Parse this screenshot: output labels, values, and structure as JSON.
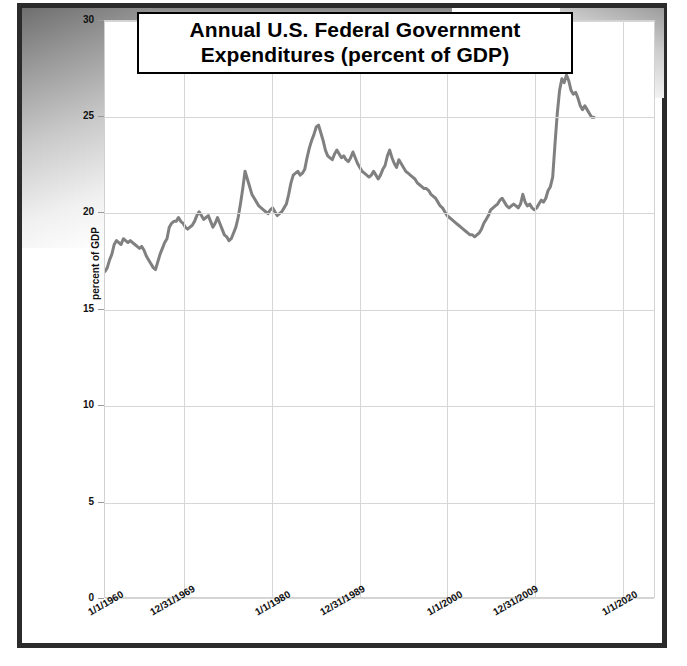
{
  "chart_data": {
    "type": "line",
    "title": "Annual U.S. Federal Government Expenditures (percent of GDP)",
    "title_line1": "Annual U.S. Federal Government",
    "title_line2": "Expenditures (percent of GDP)",
    "xlabel": "",
    "ylabel": "percent of GDP",
    "ylim": [
      0,
      30
    ],
    "yticks": [
      0,
      5,
      10,
      15,
      20,
      25,
      30
    ],
    "ytick_labels": [
      "0",
      "5",
      "10",
      "15",
      "20",
      "25",
      "30"
    ],
    "xlim": [
      "1/1/1960",
      "1/1/2020"
    ],
    "xtick_labels": [
      "1/1/1960",
      "12/31/1969",
      "1/1/1980",
      "12/31/1989",
      "1/1/2000",
      "12/31/2009",
      "1/1/2020"
    ],
    "grid": true,
    "legend": "none",
    "line_color": "#808080",
    "line_width": 3,
    "x_start_year": 1960.0,
    "x_end_year": 2020.0,
    "series": [
      {
        "name": "percent of GDP",
        "x": [
          1960.0,
          1960.25,
          1960.5,
          1960.75,
          1961.0,
          1961.25,
          1961.5,
          1961.75,
          1962.0,
          1962.25,
          1962.5,
          1962.75,
          1963.0,
          1963.25,
          1963.5,
          1963.75,
          1964.0,
          1964.25,
          1964.5,
          1964.75,
          1965.0,
          1965.25,
          1965.5,
          1965.75,
          1966.0,
          1966.25,
          1966.5,
          1966.75,
          1967.0,
          1967.25,
          1967.5,
          1967.75,
          1968.0,
          1968.25,
          1968.5,
          1968.75,
          1969.0,
          1969.25,
          1969.5,
          1969.75,
          1970.0,
          1970.25,
          1970.5,
          1970.75,
          1971.0,
          1971.25,
          1971.5,
          1971.75,
          1972.0,
          1972.25,
          1972.5,
          1972.75,
          1973.0,
          1973.25,
          1973.5,
          1973.75,
          1974.0,
          1974.25,
          1974.5,
          1974.75,
          1975.0,
          1975.25,
          1975.5,
          1975.75,
          1976.0,
          1976.25,
          1976.5,
          1976.75,
          1977.0,
          1977.25,
          1977.5,
          1977.75,
          1978.0,
          1978.25,
          1978.5,
          1978.75,
          1979.0,
          1979.25,
          1979.5,
          1979.75,
          1980.0,
          1980.25,
          1980.5,
          1980.75,
          1981.0,
          1981.25,
          1981.5,
          1981.75,
          1982.0,
          1982.25,
          1982.5,
          1982.75,
          1983.0,
          1983.25,
          1983.5,
          1983.75,
          1984.0,
          1984.25,
          1984.5,
          1984.75,
          1985.0,
          1985.25,
          1985.5,
          1985.75,
          1986.0,
          1986.25,
          1986.5,
          1986.75,
          1987.0,
          1987.25,
          1987.5,
          1987.75,
          1988.0,
          1988.25,
          1988.5,
          1988.75,
          1989.0,
          1989.25,
          1989.5,
          1989.75,
          1990.0,
          1990.25,
          1990.5,
          1990.75,
          1991.0,
          1991.25,
          1991.5,
          1991.75,
          1992.0,
          1992.25,
          1992.5,
          1992.75,
          1993.0,
          1993.25,
          1993.5,
          1993.75,
          1994.0,
          1994.25,
          1994.5,
          1994.75,
          1995.0,
          1995.25,
          1995.5,
          1995.75,
          1996.0,
          1996.25,
          1996.5,
          1996.75,
          1997.0,
          1997.25,
          1997.5,
          1997.75,
          1998.0,
          1998.25,
          1998.5,
          1998.75,
          1999.0,
          1999.25,
          1999.5,
          1999.75,
          2000.0,
          2000.25,
          2000.5,
          2000.75,
          2001.0,
          2001.25,
          2001.5,
          2001.75,
          2002.0,
          2002.25,
          2002.5,
          2002.75,
          2003.0,
          2003.25,
          2003.5,
          2003.75,
          2004.0,
          2004.25,
          2004.5,
          2004.75,
          2005.0,
          2005.25,
          2005.5,
          2005.75,
          2006.0,
          2006.25,
          2006.5,
          2006.75,
          2007.0,
          2007.25,
          2007.5,
          2007.75,
          2008.0,
          2008.25,
          2008.5,
          2008.75,
          2009.0,
          2009.25,
          2009.5,
          2009.75,
          2010.0,
          2010.25,
          2010.5,
          2010.75,
          2011.0,
          2011.25,
          2011.5,
          2011.75,
          2012.0,
          2012.25,
          2012.5,
          2012.75,
          2013.0,
          2013.25
        ],
        "values": [
          17.0,
          17.2,
          17.6,
          17.9,
          18.4,
          18.6,
          18.5,
          18.4,
          18.7,
          18.6,
          18.5,
          18.6,
          18.5,
          18.4,
          18.3,
          18.2,
          18.3,
          18.1,
          17.8,
          17.6,
          17.4,
          17.2,
          17.1,
          17.5,
          17.9,
          18.2,
          18.5,
          18.7,
          19.3,
          19.5,
          19.6,
          19.6,
          19.8,
          19.6,
          19.5,
          19.3,
          19.2,
          19.3,
          19.4,
          19.6,
          19.9,
          20.1,
          19.9,
          19.7,
          19.8,
          19.9,
          19.6,
          19.3,
          19.5,
          19.8,
          19.5,
          19.2,
          18.9,
          18.8,
          18.6,
          18.7,
          19.0,
          19.3,
          19.8,
          20.5,
          21.3,
          22.2,
          21.8,
          21.4,
          21.0,
          20.8,
          20.6,
          20.4,
          20.3,
          20.2,
          20.1,
          20.0,
          20.2,
          20.3,
          20.1,
          19.9,
          20.0,
          20.1,
          20.3,
          20.5,
          21.0,
          21.6,
          22.0,
          22.1,
          22.2,
          22.0,
          22.1,
          22.3,
          22.9,
          23.4,
          23.8,
          24.1,
          24.5,
          24.6,
          24.2,
          23.8,
          23.3,
          23.0,
          22.9,
          22.8,
          23.1,
          23.3,
          23.1,
          22.9,
          23.0,
          22.8,
          22.7,
          22.9,
          23.2,
          22.9,
          22.6,
          22.4,
          22.2,
          22.1,
          22.0,
          21.9,
          22.0,
          22.2,
          22.0,
          21.8,
          22.0,
          22.3,
          22.5,
          23.0,
          23.3,
          22.9,
          22.6,
          22.4,
          22.8,
          22.6,
          22.4,
          22.2,
          22.1,
          22.0,
          21.9,
          21.8,
          21.6,
          21.5,
          21.4,
          21.3,
          21.3,
          21.2,
          21.0,
          20.9,
          20.8,
          20.6,
          20.4,
          20.3,
          20.1,
          19.9,
          19.8,
          19.7,
          19.6,
          19.5,
          19.4,
          19.3,
          19.2,
          19.1,
          19.0,
          18.9,
          18.9,
          18.8,
          18.9,
          19.0,
          19.2,
          19.5,
          19.7,
          19.9,
          20.2,
          20.3,
          20.4,
          20.5,
          20.7,
          20.8,
          20.6,
          20.4,
          20.3,
          20.4,
          20.5,
          20.4,
          20.3,
          20.5,
          21.0,
          20.6,
          20.4,
          20.5,
          20.3,
          20.2,
          20.3,
          20.5,
          20.7,
          20.6,
          20.8,
          21.2,
          21.4,
          21.9,
          23.6,
          25.2,
          26.4,
          27.0,
          26.8,
          27.2,
          26.9,
          26.4,
          26.2,
          26.3,
          26.0,
          25.6,
          25.4,
          25.6,
          25.4,
          25.2,
          25.0,
          25.0
        ]
      }
    ]
  },
  "axes": {
    "y_title": "percent of GDP",
    "ytick_labels": [
      "30",
      "25",
      "20",
      "15",
      "10",
      "5",
      "0"
    ],
    "xtick_labels": [
      "1/1/1960",
      "12/31/1969",
      "1/1/1980",
      "12/31/1989",
      "1/1/2000",
      "12/31/2009",
      "1/1/2020"
    ]
  },
  "title": {
    "line1": "Annual U.S. Federal Government",
    "line2": "Expenditures (percent of GDP)"
  }
}
